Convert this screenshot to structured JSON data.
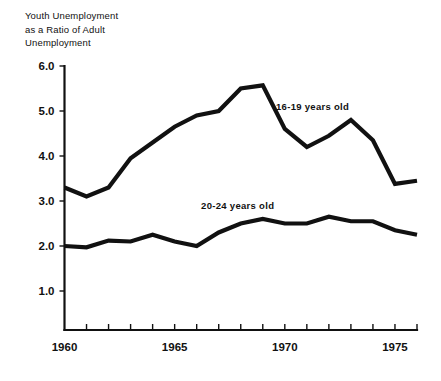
{
  "chart_data": {
    "type": "line",
    "title": "Youth Unemployment as a Ratio of Adult Unemployment",
    "title_lines": [
      "Youth Unemployment",
      "as a Ratio of Adult",
      "Unemployment"
    ],
    "xlabel": "",
    "ylabel": "",
    "xlim": [
      1960,
      1976
    ],
    "ylim": [
      0,
      6.0
    ],
    "grid": false,
    "legend_position": "inline-annotations",
    "x": [
      1960,
      1961,
      1962,
      1963,
      1964,
      1965,
      1966,
      1967,
      1968,
      1969,
      1970,
      1971,
      1972,
      1973,
      1974,
      1975,
      1976
    ],
    "xticks": [
      1960,
      1961,
      1962,
      1963,
      1964,
      1965,
      1966,
      1967,
      1968,
      1969,
      1970,
      1971,
      1972,
      1973,
      1974,
      1975,
      1976
    ],
    "xtick_labels": [
      "1960",
      "",
      "",
      "",
      "",
      "1965",
      "",
      "",
      "",
      "",
      "1970",
      "",
      "",
      "",
      "",
      "1975",
      ""
    ],
    "xtick_labels_major": [
      "1960",
      "1965",
      "1970",
      "1975"
    ],
    "yticks": [
      1.0,
      2.0,
      3.0,
      4.0,
      5.0,
      6.0
    ],
    "ytick_labels": [
      "1.0",
      "2.0",
      "3.0",
      "4.0",
      "5.0",
      "6.0"
    ],
    "series": [
      {
        "name": "16-19 years old",
        "label": "16-19  years old",
        "color": "#111111",
        "values": [
          3.3,
          3.1,
          3.3,
          3.95,
          4.3,
          4.65,
          4.9,
          5.0,
          5.5,
          5.57,
          4.6,
          4.2,
          4.45,
          4.8,
          4.35,
          3.38,
          3.45
        ]
      },
      {
        "name": "20-24 years old",
        "label": "20-24  years old",
        "color": "#111111",
        "values": [
          2.0,
          1.97,
          2.12,
          2.1,
          2.25,
          2.1,
          2.0,
          2.3,
          2.5,
          2.6,
          2.5,
          2.5,
          2.65,
          2.55,
          2.55,
          2.35,
          2.25
        ]
      }
    ],
    "annotations": [
      {
        "text": "16-19  years old",
        "x": 1969.6,
        "y": 5.02
      },
      {
        "text": "20-24  years old",
        "x": 1966.2,
        "y": 2.82
      }
    ]
  }
}
